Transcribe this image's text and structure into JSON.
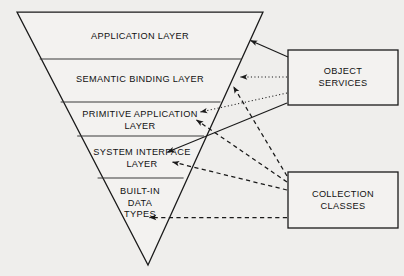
{
  "diagram": {
    "background_color": "#efeeec",
    "line_color": "#1a1a1a",
    "text_color": "#111111",
    "pyramid": {
      "name": "inverted-pyramid",
      "layers": [
        {
          "id": "application",
          "label": "APPLICATION LAYER"
        },
        {
          "id": "semantic-binding",
          "label": "SEMANTIC BINDING LAYER"
        },
        {
          "id": "primitive-application",
          "label": "PRIMITIVE APPLICATION\nLAYER"
        },
        {
          "id": "system-interface",
          "label": "SYSTEM INTERFACE\nLAYER"
        },
        {
          "id": "built-in-data-types",
          "label": "BUILT-IN\nDATA\nTYPES"
        }
      ]
    },
    "boxes": [
      {
        "id": "object-services",
        "label": "OBJECT\nSERVICES"
      },
      {
        "id": "collection-classes",
        "label": "COLLECTION\nCLASSES"
      }
    ],
    "connections": [
      {
        "id": "os-to-application",
        "from": "object-services",
        "to": "application",
        "style": "solid",
        "arrow": "target"
      },
      {
        "id": "os-to-semantic-binding",
        "from": "object-services",
        "to": "semantic-binding",
        "style": "dotted",
        "arrow": "target"
      },
      {
        "id": "os-to-primitive-application",
        "from": "object-services",
        "to": "primitive-application",
        "style": "dotted",
        "arrow": "target"
      },
      {
        "id": "os-to-system-interface",
        "from": "object-services",
        "to": "system-interface",
        "style": "solid",
        "arrow": "target"
      },
      {
        "id": "cc-to-semantic-binding",
        "from": "collection-classes",
        "to": "semantic-binding",
        "style": "dashed",
        "arrow": "target"
      },
      {
        "id": "cc-to-primitive-application",
        "from": "collection-classes",
        "to": "primitive-application",
        "style": "dashed",
        "arrow": "target"
      },
      {
        "id": "cc-to-system-interface",
        "from": "collection-classes",
        "to": "system-interface",
        "style": "dashed",
        "arrow": "target"
      },
      {
        "id": "cc-to-built-in-data-types",
        "from": "collection-classes",
        "to": "built-in-data-types",
        "style": "dashed",
        "arrow": "target"
      }
    ]
  }
}
